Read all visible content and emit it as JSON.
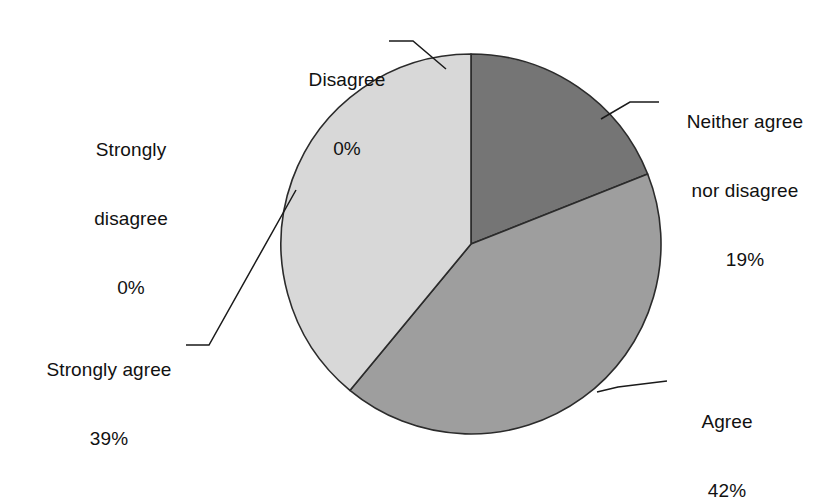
{
  "chart_data": {
    "type": "pie",
    "title": "",
    "subtitle": "",
    "xlabel": "",
    "ylabel": "",
    "legend_position": "none",
    "grid": false,
    "labels_show_percent": true,
    "start_angle_deg": 0,
    "direction": "clockwise",
    "categories": [
      "Disagree",
      "Neither agree nor disagree",
      "Agree",
      "Strongly agree",
      "Strongly disagree"
    ],
    "values": [
      0,
      19,
      42,
      39,
      0
    ],
    "value_labels": [
      "0%",
      "19%",
      "42%",
      "39%",
      "0%"
    ],
    "colors": [
      "#ffffff",
      "#757575",
      "#9e9e9e",
      "#d8d8d8",
      "#ffffff"
    ],
    "slices": [
      {
        "name": "Disagree",
        "value": 0,
        "percent_label": "0%",
        "color": "#ffffff",
        "start_deg": 0,
        "end_deg": 0,
        "has_leader_line": true
      },
      {
        "name": "Neither agree nor disagree",
        "name_line1": "Neither agree",
        "name_line2": "nor disagree",
        "value": 19,
        "percent_label": "19%",
        "color": "#757575",
        "start_deg": 0,
        "end_deg": 68.4,
        "has_leader_line": true
      },
      {
        "name": "Agree",
        "value": 42,
        "percent_label": "42%",
        "color": "#9e9e9e",
        "start_deg": 68.4,
        "end_deg": 219.6,
        "has_leader_line": true
      },
      {
        "name": "Strongly agree",
        "value": 39,
        "percent_label": "39%",
        "color": "#d8d8d8",
        "start_deg": 219.6,
        "end_deg": 360,
        "has_leader_line": true
      },
      {
        "name": "Strongly disagree",
        "name_line1": "Strongly",
        "name_line2": "disagree",
        "value": 0,
        "percent_label": "0%",
        "color": "#ffffff",
        "start_deg": 360,
        "end_deg": 360,
        "has_leader_line": false
      }
    ]
  },
  "labels": {
    "disagree": {
      "name": "Disagree",
      "percent": "0%"
    },
    "neither": {
      "line1": "Neither agree",
      "line2": "nor disagree",
      "percent": "19%"
    },
    "strongly_disagree": {
      "line1": "Strongly",
      "line2": "disagree",
      "percent": "0%"
    },
    "strongly_agree": {
      "name": "Strongly agree",
      "percent": "39%"
    },
    "agree": {
      "name": "Agree",
      "percent": "42%"
    }
  },
  "geometry": {
    "center_x": 471,
    "center_y": 244,
    "radius": 190
  },
  "style": {
    "background": "#ffffff",
    "outline": "#2b2b2b",
    "leader_line": "#1a1a1a",
    "text": "#111111"
  }
}
